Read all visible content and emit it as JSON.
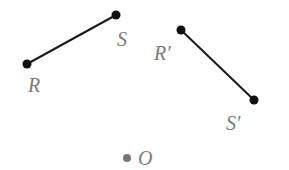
{
  "diagram": {
    "points": [
      {
        "id": "R",
        "label": "R",
        "x": 27,
        "y": 64,
        "lx": 28,
        "ly": 92
      },
      {
        "id": "S",
        "label": "S",
        "x": 116,
        "y": 15,
        "lx": 117,
        "ly": 46
      },
      {
        "id": "R_prime",
        "label": "R′",
        "x": 181,
        "y": 30,
        "lx": 154,
        "ly": 60
      },
      {
        "id": "S_prime",
        "label": "S′",
        "x": 254,
        "y": 100,
        "lx": 226,
        "ly": 130
      },
      {
        "id": "O",
        "label": "O",
        "x": 127,
        "y": 158,
        "lx": 138,
        "ly": 165
      }
    ],
    "segments": [
      {
        "from": "R",
        "to": "S"
      },
      {
        "from": "R_prime",
        "to": "S_prime"
      }
    ],
    "colors": {
      "line": "#1a1a1a",
      "point": "#111111",
      "center": "#777777",
      "label": "#7a7a7a"
    }
  }
}
